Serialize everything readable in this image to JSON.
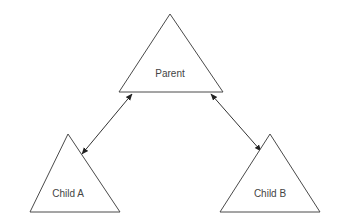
{
  "diagram": {
    "nodes": [
      {
        "id": "parent",
        "label": "Parent",
        "shape": "triangle"
      },
      {
        "id": "childA",
        "label": "Child A",
        "shape": "triangle"
      },
      {
        "id": "childB",
        "label": "Child B",
        "shape": "triangle"
      }
    ],
    "edges": [
      {
        "from": "parent",
        "to": "childA",
        "direction": "bidirectional"
      },
      {
        "from": "parent",
        "to": "childB",
        "direction": "bidirectional"
      }
    ],
    "colors": {
      "stroke": "#4a4a4a",
      "text": "#444444",
      "background": "#ffffff"
    }
  }
}
